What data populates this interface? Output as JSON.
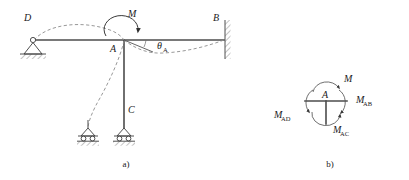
{
  "figure": {
    "type": "structural-engineering-diagram",
    "captions": {
      "left": "a)",
      "right": "b)"
    }
  },
  "frame": {
    "title_label": "",
    "joints": [
      {
        "id": "D",
        "label": "D",
        "support": "pin",
        "x": 33,
        "y": 40
      },
      {
        "id": "A",
        "label": "A",
        "support": "rigid-joint",
        "x": 124,
        "y": 40
      },
      {
        "id": "B",
        "label": "B",
        "support": "fixed",
        "x": 224,
        "y": 40
      },
      {
        "id": "C",
        "label": "C",
        "support": "roller",
        "x": 124,
        "y": 128
      }
    ],
    "members": [
      {
        "name": "beam-DA",
        "from": "D",
        "to": "A"
      },
      {
        "name": "beam-AB",
        "from": "A",
        "to": "B"
      },
      {
        "name": "column-AC",
        "from": "A",
        "to": "C"
      }
    ],
    "applied_moment": {
      "label": "M",
      "direction": "clockwise",
      "at_joint": "A"
    },
    "rotation": {
      "label": "θ",
      "subscript": "A",
      "at_joint": "A"
    },
    "deflected_shape": {
      "style": "dashed",
      "description": "Deflected shape of beam and column under moment M"
    },
    "secondary_support": {
      "name": "auxiliary-roller-support",
      "x": 88,
      "y": 128
    }
  },
  "joint_fbd": {
    "center_label": "A",
    "moments": [
      {
        "name": "moment-M",
        "label": "M",
        "position": "top",
        "subscript": ""
      },
      {
        "name": "moment-MAB",
        "label": "M",
        "subscript": "AB",
        "position": "right"
      },
      {
        "name": "moment-MAC",
        "label": "M",
        "subscript": "AC",
        "position": "bottom"
      },
      {
        "name": "moment-MAD",
        "label": "M",
        "subscript": "AD",
        "position": "left"
      }
    ],
    "stub_members": [
      "left",
      "right",
      "down"
    ]
  },
  "colors": {
    "member": "#4c4c4c",
    "deflection": "#8c8c8c",
    "text": "#1a1a1a",
    "support": "#3d3d3d",
    "background": "#ffffff"
  }
}
